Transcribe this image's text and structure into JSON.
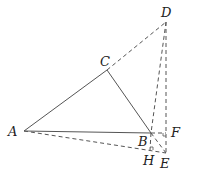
{
  "figure": {
    "type": "geometry-diagram",
    "points": {
      "A": {
        "label": "A",
        "x": 24,
        "y": 131
      },
      "B": {
        "label": "B",
        "x": 151,
        "y": 133
      },
      "C": {
        "label": "C",
        "x": 107,
        "y": 70
      },
      "D": {
        "label": "D",
        "x": 166,
        "y": 22
      },
      "E": {
        "label": "E",
        "x": 166,
        "y": 153
      },
      "F": {
        "label": "F",
        "x": 166,
        "y": 133
      },
      "H": {
        "label": "H",
        "x": 150,
        "y": 150
      }
    },
    "solid_segments": [
      "AC",
      "CB",
      "AB"
    ],
    "dashed_segments": [
      "CD",
      "DF",
      "FE",
      "DB",
      "BE",
      "AE",
      "BH",
      "BF"
    ],
    "right_angles": [
      "F",
      "H"
    ],
    "colors": {
      "line": "#555555",
      "text": "#222222",
      "background": "#ffffff"
    }
  }
}
